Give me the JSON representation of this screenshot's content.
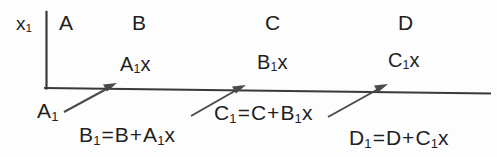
{
  "figure": {
    "axis_label": {
      "base": "x",
      "sub": "1"
    },
    "colors": {
      "ink": "#1f1f1f",
      "rule": "#3a3a3a",
      "arrow": "#4a4a4a",
      "background": "#fdfdfd"
    }
  },
  "columns": [
    {
      "name": "column-a",
      "label": "A"
    },
    {
      "name": "column-b",
      "label": "B"
    },
    {
      "name": "column-c",
      "label": "C"
    },
    {
      "name": "column-d",
      "label": "D"
    }
  ],
  "products": [
    {
      "name": "product-a1x",
      "base": "A",
      "sub": "1",
      "tail": "x"
    },
    {
      "name": "product-b1x",
      "base": "B",
      "sub": "1",
      "tail": "x"
    },
    {
      "name": "product-c1x",
      "base": "C",
      "sub": "1",
      "tail": "x"
    }
  ],
  "carry": {
    "base": "A",
    "sub": "1"
  },
  "equations": [
    {
      "name": "equation-b1",
      "lhs_base": "B",
      "lhs_sub": "1",
      "eq": "=",
      "term1": "B",
      "plus": "+",
      "term2_base": "A",
      "term2_sub": "1",
      "term2_tail": "x",
      "text": "B1 = B + A1x"
    },
    {
      "name": "equation-c1",
      "lhs_base": "C",
      "lhs_sub": "1",
      "eq": "=",
      "term1": "C",
      "plus": "+",
      "term2_base": "B",
      "term2_sub": "1",
      "term2_tail": "x",
      "text": "C1 = C + B1x"
    },
    {
      "name": "equation-d1",
      "lhs_base": "D",
      "lhs_sub": "1",
      "eq": "=",
      "term1": "D",
      "plus": "+",
      "term2_base": "C",
      "term2_sub": "1",
      "term2_tail": "x",
      "text": "D1 = D + C1x"
    }
  ],
  "arrows": [
    {
      "name": "arrow-a1-to-a1x",
      "from": [
        64,
        112
      ],
      "to": [
        116,
        84
      ]
    },
    {
      "name": "arrow-b1-to-b1x",
      "from": [
        193,
        114
      ],
      "to": [
        245,
        86
      ]
    },
    {
      "name": "arrow-c1-to-c1x",
      "from": [
        330,
        116
      ],
      "to": [
        388,
        85
      ]
    }
  ]
}
